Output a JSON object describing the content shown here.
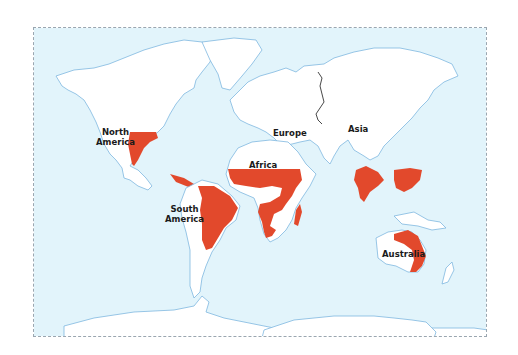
{
  "map": {
    "colors": {
      "ocean": "#e2f4fb",
      "land": "#ffffff",
      "coastline": "#7fb8e0",
      "highlight": "#e2492c",
      "frame": "#9aa6b0",
      "border_line": "#333333"
    },
    "labels": {
      "north_america": "North\nAmerica",
      "south_america": "South\nAmerica",
      "europe": "Europe",
      "asia": "Asia",
      "africa": "Africa",
      "australia": "Australia"
    },
    "highlighted_regions": [
      "Southern United States",
      "Central America",
      "Northern and Central South America",
      "Sub-Saharan Africa",
      "Madagascar",
      "India",
      "Southern China",
      "Northern and Eastern Australia"
    ]
  }
}
